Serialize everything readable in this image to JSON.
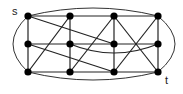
{
  "diagram": {
    "type": "graph",
    "labels": {
      "source": "s",
      "sink": "t"
    },
    "nodes": [
      {
        "id": "s",
        "col": 0,
        "row": 0
      },
      {
        "id": "a2",
        "col": 1,
        "row": 0
      },
      {
        "id": "a3",
        "col": 2,
        "row": 0
      },
      {
        "id": "a4",
        "col": 3,
        "row": 0
      },
      {
        "id": "b1",
        "col": 0,
        "row": 1
      },
      {
        "id": "b2",
        "col": 1,
        "row": 1
      },
      {
        "id": "b3",
        "col": 2,
        "row": 1
      },
      {
        "id": "b4",
        "col": 3,
        "row": 1
      },
      {
        "id": "c1",
        "col": 0,
        "row": 2
      },
      {
        "id": "c2",
        "col": 1,
        "row": 2
      },
      {
        "id": "c3",
        "col": 2,
        "row": 2
      },
      {
        "id": "t",
        "col": 3,
        "row": 2
      }
    ],
    "edges": [
      [
        "s",
        "a2"
      ],
      [
        "a2",
        "a3"
      ],
      [
        "a3",
        "a4"
      ],
      [
        "b1",
        "b2"
      ],
      [
        "b2",
        "b3"
      ],
      [
        "b3",
        "b4"
      ],
      [
        "c1",
        "c2"
      ],
      [
        "c2",
        "c3"
      ],
      [
        "c3",
        "t"
      ],
      [
        "s",
        "b1"
      ],
      [
        "b1",
        "c1"
      ],
      [
        "a2",
        "b2"
      ],
      [
        "b2",
        "c2"
      ],
      [
        "a3",
        "b3"
      ],
      [
        "b3",
        "c3"
      ],
      [
        "a4",
        "b4"
      ],
      [
        "b4",
        "t"
      ],
      [
        "s",
        "b3"
      ],
      [
        "a2",
        "c1"
      ],
      [
        "b1",
        "c3"
      ],
      [
        "a3",
        "c2"
      ],
      [
        "a3",
        "t"
      ],
      [
        "a4",
        "c3"
      ]
    ],
    "curved_edges": [
      [
        "b2",
        "b4"
      ]
    ],
    "outer_arcs": [
      [
        "s",
        "a4",
        "top"
      ],
      [
        "c1",
        "t",
        "bottom"
      ],
      [
        "s",
        "c1",
        "left"
      ],
      [
        "a4",
        "t",
        "right"
      ]
    ]
  }
}
